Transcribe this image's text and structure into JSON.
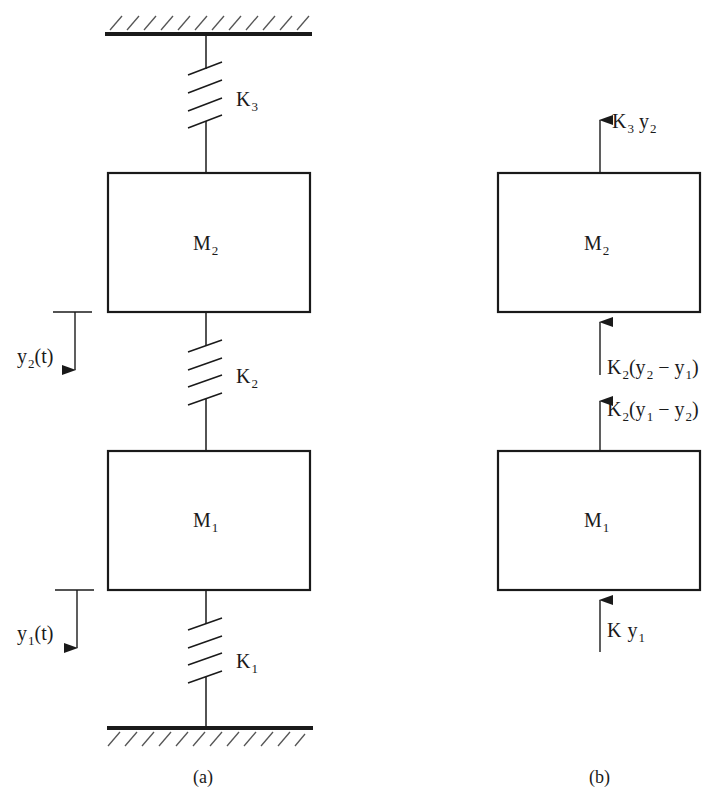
{
  "figure": {
    "panel_a": {
      "caption": "(a)",
      "masses": [
        {
          "name": "M",
          "sub": "2"
        },
        {
          "name": "M",
          "sub": "1"
        }
      ],
      "springs": [
        {
          "name": "K",
          "sub": "3"
        },
        {
          "name": "K",
          "sub": "2"
        },
        {
          "name": "K",
          "sub": "1"
        }
      ],
      "displacements": [
        {
          "name": "y",
          "sub": "2",
          "suffix": "(t)"
        },
        {
          "name": "y",
          "sub": "1",
          "suffix": "(t)"
        }
      ]
    },
    "panel_b": {
      "caption": "(b)",
      "masses": [
        {
          "name": "M",
          "sub": "2"
        },
        {
          "name": "M",
          "sub": "1"
        }
      ],
      "forces": [
        {
          "k": "K",
          "ksub": "3",
          "expr_pre": " y",
          "expr_sub": "2",
          "expr_post": ""
        },
        {
          "k": "K",
          "ksub": "2",
          "expr_pre": "(y",
          "expr_sub": "2",
          "mid": " − y",
          "mid_sub": "1",
          "expr_post": ")"
        },
        {
          "k": "K",
          "ksub": "2",
          "expr_pre": "(y",
          "expr_sub": "1",
          "mid": " − y",
          "mid_sub": "2",
          "expr_post": ")"
        },
        {
          "k": "K",
          "ksub": "",
          "expr_pre": " y",
          "expr_sub": "1",
          "expr_post": ""
        }
      ]
    },
    "colors": {
      "ink": "#1a1a1a",
      "background": "#ffffff"
    }
  }
}
